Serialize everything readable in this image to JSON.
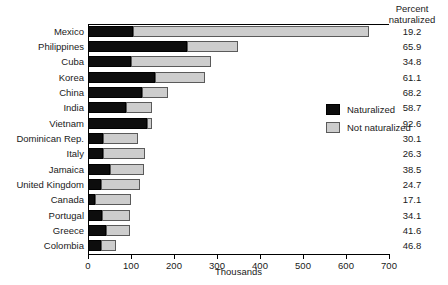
{
  "chart_data": {
    "type": "bar",
    "subtype": "stacked-horizontal",
    "title": "",
    "xlabel": "Thousands",
    "ylabel": "",
    "xlim": [
      0,
      700
    ],
    "xticks": [
      0,
      100,
      200,
      300,
      400,
      500,
      600,
      700
    ],
    "grid": false,
    "legend_position": "inside-upper-right",
    "categories": [
      "Mexico",
      "Philippines",
      "Cuba",
      "Korea",
      "China",
      "India",
      "Vietnam",
      "Dominican Rep.",
      "Italy",
      "Jamaica",
      "United Kingdom",
      "Canada",
      "Portugal",
      "Greece",
      "Colombia"
    ],
    "series": [
      {
        "name": "Naturalized",
        "color": "#0d0d0d",
        "values": [
          104,
          231,
          99,
          155,
          126,
          88,
          137,
          35,
          35,
          50,
          30,
          17,
          33,
          41,
          31
        ]
      },
      {
        "name": "Not naturalized",
        "color": "#cdcdcd",
        "values": [
          549,
          119,
          186,
          117,
          59,
          62,
          11,
          81,
          98,
          80,
          92,
          82,
          64,
          57,
          35
        ]
      }
    ],
    "annotations": {
      "right_column_header": [
        "Percent",
        "naturalized"
      ],
      "right_column_values": [
        "19.2",
        "65.9",
        "34.8",
        "61.1",
        "68.2",
        "58.7",
        "92.6",
        "30.1",
        "26.3",
        "38.5",
        "24.7",
        "17.1",
        "34.1",
        "41.6",
        "46.8"
      ]
    }
  },
  "legend": {
    "items": [
      {
        "label": "Naturalized",
        "color": "#0d0d0d"
      },
      {
        "label": "Not naturalized",
        "color": "#cdcdcd"
      }
    ]
  },
  "axis": {
    "x_title": "Thousands",
    "tick_labels": [
      "0",
      "100",
      "200",
      "300",
      "400",
      "500",
      "600",
      "700"
    ]
  },
  "right_panel": {
    "header_line1": "Percent",
    "header_line2": "naturalized"
  }
}
